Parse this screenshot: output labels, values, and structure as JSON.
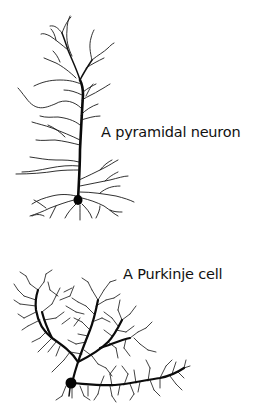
{
  "figure": {
    "background": "#ffffff",
    "ink_color": "#111111",
    "neurons": [
      {
        "id": "pyramidal",
        "label": "A pyramidal neuron"
      },
      {
        "id": "purkinje",
        "label": "A Purkinje cell"
      }
    ]
  }
}
